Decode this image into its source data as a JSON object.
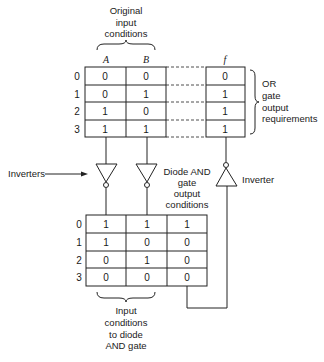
{
  "labels": {
    "original_input": [
      "Original",
      "input",
      "conditions"
    ],
    "or_gate": [
      "OR",
      "gate",
      "output",
      "requirements"
    ],
    "inverters": "Inverters",
    "diode_and": [
      "Diode AND",
      "gate",
      "output",
      "conditions"
    ],
    "inverter": "Inverter",
    "input_to_diode": [
      "Input",
      "conditions",
      "to diode",
      "AND gate"
    ]
  },
  "top_table": {
    "headers": [
      "A",
      "B",
      "f"
    ],
    "row_indices": [
      "0",
      "1",
      "2",
      "3"
    ],
    "rows": [
      {
        "A": "0",
        "B": "0",
        "f": "0"
      },
      {
        "A": "0",
        "B": "1",
        "f": "1"
      },
      {
        "A": "1",
        "B": "0",
        "f": "1"
      },
      {
        "A": "1",
        "B": "1",
        "f": "1"
      }
    ]
  },
  "bottom_table": {
    "row_indices": [
      "0",
      "1",
      "2",
      "3"
    ],
    "rows": [
      [
        "1",
        "1",
        "1"
      ],
      [
        "1",
        "0",
        "0"
      ],
      [
        "0",
        "1",
        "0"
      ],
      [
        "0",
        "0",
        "0"
      ]
    ]
  }
}
